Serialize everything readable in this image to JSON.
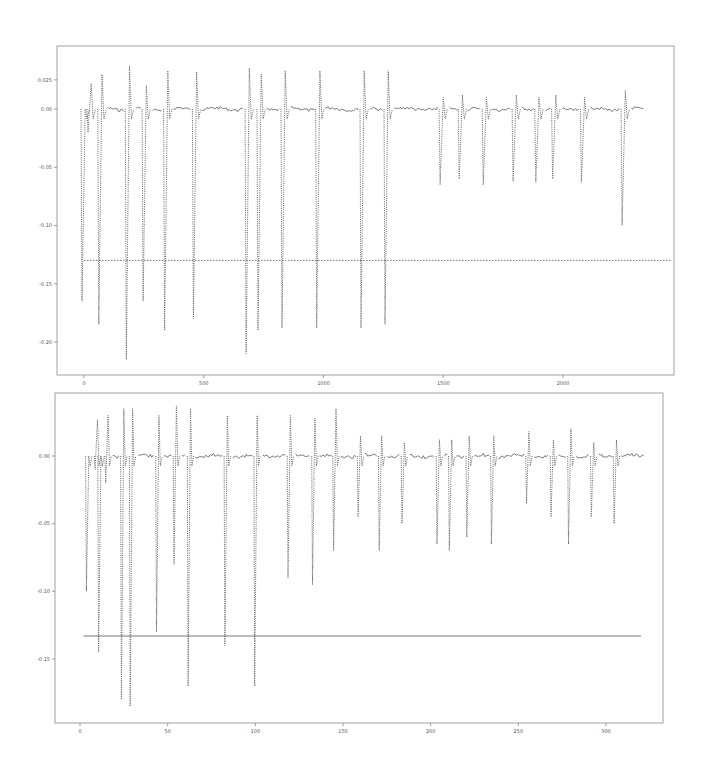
{
  "chart_data": [
    {
      "type": "line",
      "title": "",
      "xlabel": "",
      "ylabel": "",
      "xlim": [
        -100,
        2450
      ],
      "ylim": [
        -0.22,
        0.027
      ],
      "x_ticks": [
        "0",
        "500",
        "1000",
        "1500",
        "2000"
      ],
      "y_ticks": [
        "0.025",
        "0.00",
        "-0.05",
        "-0.10",
        "-0.15",
        "-0.20"
      ],
      "grid": false,
      "legend": null,
      "series": [
        {
          "name": "signal",
          "style": "line with dotted large excursions",
          "baseline": 0.0,
          "spikes": [
            {
              "x": 5,
              "max": 0.0,
              "min": -0.165
            },
            {
              "x": 30,
              "max": 0.022,
              "min": -0.02
            },
            {
              "x": 75,
              "max": 0.03,
              "min": -0.185
            },
            {
              "x": 190,
              "max": 0.037,
              "min": -0.215
            },
            {
              "x": 260,
              "max": 0.02,
              "min": -0.165
            },
            {
              "x": 350,
              "max": 0.033,
              "min": -0.19
            },
            {
              "x": 470,
              "max": 0.032,
              "min": -0.18
            },
            {
              "x": 690,
              "max": 0.035,
              "min": -0.21
            },
            {
              "x": 740,
              "max": 0.03,
              "min": -0.19
            },
            {
              "x": 840,
              "max": 0.033,
              "min": -0.188
            },
            {
              "x": 985,
              "max": 0.033,
              "min": -0.188
            },
            {
              "x": 1170,
              "max": 0.033,
              "min": -0.188
            },
            {
              "x": 1270,
              "max": 0.033,
              "min": -0.185
            },
            {
              "x": 1500,
              "max": 0.01,
              "min": -0.065
            },
            {
              "x": 1580,
              "max": 0.012,
              "min": -0.06
            },
            {
              "x": 1680,
              "max": 0.01,
              "min": -0.065
            },
            {
              "x": 1805,
              "max": 0.012,
              "min": -0.062
            },
            {
              "x": 1900,
              "max": 0.01,
              "min": -0.063
            },
            {
              "x": 1970,
              "max": 0.012,
              "min": -0.06
            },
            {
              "x": 2090,
              "max": 0.01,
              "min": -0.063
            },
            {
              "x": 2260,
              "max": 0.016,
              "min": -0.1
            }
          ]
        },
        {
          "name": "threshold",
          "style": "dotted horizontal line",
          "x": [
            0,
            2450
          ],
          "y": [
            -0.13,
            -0.13
          ]
        }
      ]
    },
    {
      "type": "line",
      "title": "",
      "xlabel": "",
      "ylabel": "",
      "xlim": [
        -15,
        335
      ],
      "ylim": [
        -0.195,
        0.045
      ],
      "x_ticks": [
        "0",
        "50",
        "100",
        "150",
        "200",
        "250",
        "300"
      ],
      "y_ticks": [
        "0.00",
        "-0.05",
        "-0.10",
        "-0.15"
      ],
      "grid": false,
      "legend": null,
      "series": [
        {
          "name": "signal",
          "style": "line with dotted large excursions",
          "baseline": 0.0,
          "spikes": [
            {
              "x": 5,
              "max": 0.0,
              "min": -0.1
            },
            {
              "x": 10,
              "max": 0.027,
              "min": -0.01
            },
            {
              "x": 12,
              "max": 0.0,
              "min": -0.145
            },
            {
              "x": 16,
              "max": 0.03,
              "min": -0.02
            },
            {
              "x": 25,
              "max": 0.035,
              "min": -0.18
            },
            {
              "x": 30,
              "max": 0.035,
              "min": -0.185
            },
            {
              "x": 45,
              "max": 0.03,
              "min": -0.13
            },
            {
              "x": 55,
              "max": 0.037,
              "min": -0.08
            },
            {
              "x": 63,
              "max": 0.035,
              "min": -0.17
            },
            {
              "x": 84,
              "max": 0.03,
              "min": -0.14
            },
            {
              "x": 101,
              "max": 0.03,
              "min": -0.17
            },
            {
              "x": 120,
              "max": 0.03,
              "min": -0.09
            },
            {
              "x": 134,
              "max": 0.028,
              "min": -0.095
            },
            {
              "x": 146,
              "max": 0.035,
              "min": -0.07
            },
            {
              "x": 160,
              "max": 0.015,
              "min": -0.045
            },
            {
              "x": 172,
              "max": 0.015,
              "min": -0.07
            },
            {
              "x": 185,
              "max": 0.01,
              "min": -0.05
            },
            {
              "x": 205,
              "max": 0.012,
              "min": -0.065
            },
            {
              "x": 212,
              "max": 0.012,
              "min": -0.07
            },
            {
              "x": 222,
              "max": 0.015,
              "min": -0.06
            },
            {
              "x": 236,
              "max": 0.015,
              "min": -0.065
            },
            {
              "x": 256,
              "max": 0.018,
              "min": -0.035
            },
            {
              "x": 270,
              "max": 0.012,
              "min": -0.045
            },
            {
              "x": 280,
              "max": 0.02,
              "min": -0.065
            },
            {
              "x": 293,
              "max": 0.01,
              "min": -0.045
            },
            {
              "x": 306,
              "max": 0.012,
              "min": -0.05
            }
          ]
        },
        {
          "name": "threshold",
          "style": "solid horizontal line",
          "x": [
            2,
            320
          ],
          "y": [
            -0.133,
            -0.133
          ]
        }
      ]
    }
  ]
}
